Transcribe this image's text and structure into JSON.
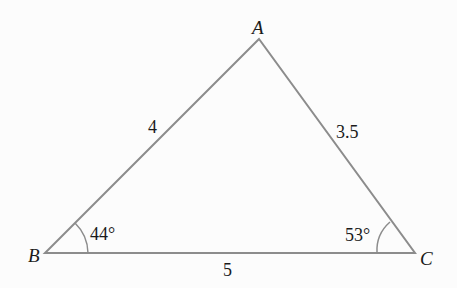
{
  "diagram": {
    "type": "triangle",
    "vertices": [
      {
        "name": "A",
        "x": 259,
        "y": 39
      },
      {
        "name": "B",
        "x": 45,
        "y": 253
      },
      {
        "name": "C",
        "x": 415,
        "y": 253
      }
    ],
    "sides": [
      {
        "between": "AB",
        "label": "4"
      },
      {
        "between": "AC",
        "label": "3.5"
      },
      {
        "between": "BC",
        "label": "5"
      }
    ],
    "angles": [
      {
        "at": "B",
        "label": "44°"
      },
      {
        "at": "C",
        "label": "53°"
      }
    ],
    "colors": {
      "line": "#8c8c8c",
      "text": "#1a1a1a",
      "background": "#fcfcfc"
    }
  }
}
